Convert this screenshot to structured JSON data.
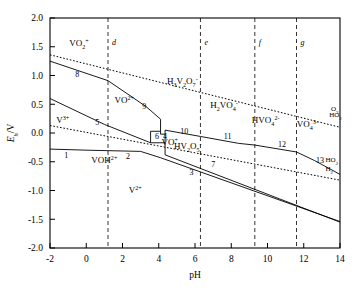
{
  "figure": {
    "xlabel": "pH",
    "ylabel_main": "E",
    "ylabel_sub": "h",
    "ylabel_unit": "/V"
  },
  "chart_data": {
    "type": "line",
    "title": "",
    "xlabel": "pH",
    "ylabel": "Eh/V",
    "xlim": [
      -2,
      14
    ],
    "ylim": [
      -2.0,
      2.0
    ],
    "grid": false,
    "legend": "none",
    "xticks": [
      -2,
      0,
      2,
      4,
      6,
      8,
      10,
      12,
      14
    ],
    "xticklabels": [
      "-2",
      "0",
      "2",
      "4",
      "6",
      "8",
      "10",
      "12",
      "14"
    ],
    "yticks": [
      -2.0,
      -1.5,
      -1.0,
      -0.5,
      0.0,
      0.5,
      1.0,
      1.5,
      2.0
    ],
    "yticklabels": [
      "-2.0",
      "-1.5",
      "-1.0",
      "-0.5",
      "0.0",
      "0.5",
      "1.0",
      "1.5",
      "2.0"
    ],
    "species_labels": [
      {
        "id": "vo2-plus",
        "text": "VO2+",
        "html": "VO<tspan class=\"sub\">2</tspan><tspan class=\"sup\">+</tspan>",
        "pH": -0.4,
        "E": 1.52
      },
      {
        "id": "vo-2plus",
        "text": "VO2+",
        "html": "VO<tspan class=\"sup\">2+</tspan>",
        "pH": 2.1,
        "E": 0.52
      },
      {
        "id": "v-3plus",
        "text": "V3+",
        "html": "V<tspan class=\"sup\">3+</tspan>",
        "pH": -1.3,
        "E": 0.17
      },
      {
        "id": "voh-2plus",
        "text": "VOH2+",
        "html": "VOH<tspan class=\"sup\">2+</tspan>",
        "pH": 1.0,
        "E": -0.53
      },
      {
        "id": "v-2plus",
        "text": "V2+",
        "html": "V<tspan class=\"sup\">2+</tspan>",
        "pH": 2.7,
        "E": -1.05
      },
      {
        "id": "vo-plus",
        "text": "VO+",
        "html": "VO<tspan class=\"sup\">+</tspan>",
        "pH": 4.6,
        "E": -0.21
      },
      {
        "id": "h3v2o7-minus",
        "text": "H3V2O7-",
        "html": "H<tspan class=\"sub\">3</tspan>V<tspan class=\"sub\">2</tspan>O<tspan class=\"sub\">7</tspan><tspan class=\"sup\">-</tspan>",
        "pH": 5.3,
        "E": 0.86
      },
      {
        "id": "hv2o5-minus",
        "text": "HV2O5-",
        "html": "HV<tspan class=\"sub\">2</tspan>O<tspan class=\"sub\">5</tspan><tspan class=\"sup\">-</tspan>",
        "pH": 5.6,
        "E": -0.27
      },
      {
        "id": "h2vo4-minus",
        "text": "H2VO4-",
        "html": "H<tspan class=\"sub\">2</tspan>VO<tspan class=\"sub\">4</tspan><tspan class=\"sup\">-</tspan>",
        "pH": 7.6,
        "E": 0.43
      },
      {
        "id": "hvo4-2minus",
        "text": "HVO42-",
        "html": "HVO<tspan class=\"sub\">4</tspan><tspan class=\"sup\">2-</tspan>",
        "pH": 9.9,
        "E": 0.18
      },
      {
        "id": "vo4-3minus",
        "text": "VO43-",
        "html": "VO<tspan class=\"sub\">4</tspan><tspan class=\"sup\">3-</tspan>",
        "pH": 12.2,
        "E": 0.1
      }
    ],
    "boundary_numbers": [
      {
        "label": "1",
        "pH": -1.1,
        "E": -0.38
      },
      {
        "label": "2",
        "pH": 2.3,
        "E": -0.4
      },
      {
        "label": "3",
        "pH": 5.8,
        "E": -0.68
      },
      {
        "label": "4",
        "pH": 4.35,
        "E": -0.05
      },
      {
        "label": "5",
        "pH": 0.6,
        "E": 0.2
      },
      {
        "label": "6",
        "pH": 3.9,
        "E": -0.05
      },
      {
        "label": "7",
        "pH": 7.0,
        "E": -0.54
      },
      {
        "label": "8",
        "pH": -0.5,
        "E": 1.03
      },
      {
        "label": "9",
        "pH": 3.2,
        "E": 0.47
      },
      {
        "label": "10",
        "pH": 5.4,
        "E": 0.04
      },
      {
        "label": "11",
        "pH": 7.8,
        "E": -0.05
      },
      {
        "label": "12",
        "pH": 10.8,
        "E": -0.19
      },
      {
        "label": "13",
        "pH": 12.9,
        "E": -0.47
      }
    ],
    "vertical_lines": [
      {
        "label": "d",
        "pH": 1.2
      },
      {
        "label": "e",
        "pH": 6.3
      },
      {
        "label": "f",
        "pH": 9.3
      },
      {
        "label": "g",
        "pH": 11.6
      }
    ],
    "water_lines": [
      {
        "id": "oxygen-line",
        "style": "dotted",
        "points": [
          [
            -2,
            1.36
          ],
          [
            14,
            0.1
          ]
        ],
        "annotations": [
          "O2",
          "HO2"
        ]
      },
      {
        "id": "hydrogen-line",
        "style": "dotted",
        "points": [
          [
            -2,
            0.13
          ],
          [
            14,
            -0.82
          ]
        ],
        "annotations": [
          "H2"
        ]
      }
    ],
    "corner_annotations": [
      {
        "id": "o2-annot",
        "text": "O2",
        "html": "O<tspan class=\"sub\">2</tspan>",
        "pH": 13.5,
        "E": 0.38
      },
      {
        "id": "ho2-annot",
        "text": "HO2",
        "html": "HO<tspan class=\"sub\">2</tspan>",
        "pH": 13.4,
        "E": 0.28
      },
      {
        "id": "ho2b-annot",
        "text": "HO2",
        "html": "HO<tspan class=\"sub\">2</tspan>",
        "pH": 13.2,
        "E": -0.5
      },
      {
        "id": "h2-annot",
        "text": "H2",
        "html": "H<tspan class=\"sub\">2</tspan>",
        "pH": 13.2,
        "E": -0.66
      }
    ]
  }
}
